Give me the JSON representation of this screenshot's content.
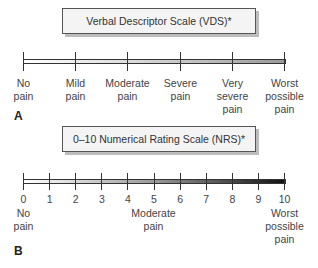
{
  "panel_a": {
    "letter": "A",
    "title": "Verbal Descriptor Scale (VDS)*",
    "ticks": [
      23,
      75,
      127,
      180,
      232,
      284
    ],
    "labels": [
      {
        "x": 23,
        "text": "No\npain"
      },
      {
        "x": 75,
        "text": "Mild\npain"
      },
      {
        "x": 127,
        "text": "Moderate\npain"
      },
      {
        "x": 180,
        "text": "Severe\npain"
      },
      {
        "x": 232,
        "text": "Very\nsevere\npain"
      },
      {
        "x": 284,
        "text": "Worst\npossible\npain"
      }
    ]
  },
  "panel_b": {
    "letter": "B",
    "title": "0–10 Numerical Rating Scale (NRS)*",
    "numbers": [
      "0",
      "1",
      "2",
      "3",
      "4",
      "5",
      "6",
      "7",
      "8",
      "9",
      "10"
    ],
    "anchors": [
      {
        "x": 23,
        "text": "No\npain"
      },
      {
        "x": 153,
        "text": "Moderate\npain"
      },
      {
        "x": 284,
        "text": "Worst\npossible\npain"
      }
    ]
  }
}
